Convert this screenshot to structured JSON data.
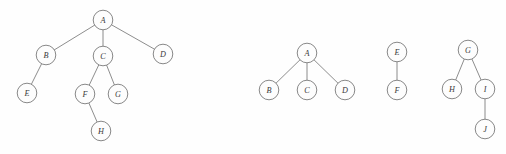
{
  "figure": {
    "background_color": "#fefefe",
    "node_fill": "#fdfdfd",
    "node_stroke": "#7a7a7a",
    "edge_color": "#808080",
    "label_color": "#3a3a3a",
    "node_radius": 9.8,
    "width": 506,
    "height": 154
  },
  "graphs": [
    {
      "id": "tree-1",
      "name": "tree-left-abcdefgh",
      "root": "A",
      "nodes": [
        {
          "id": "A",
          "label": "A",
          "x": 103,
          "y": 20
        },
        {
          "id": "B",
          "label": "B",
          "x": 46,
          "y": 55
        },
        {
          "id": "C",
          "label": "C",
          "x": 103,
          "y": 56
        },
        {
          "id": "D",
          "label": "D",
          "x": 163,
          "y": 54
        },
        {
          "id": "E",
          "label": "E",
          "x": 27,
          "y": 93
        },
        {
          "id": "F",
          "label": "F",
          "x": 85,
          "y": 94
        },
        {
          "id": "G",
          "label": "G",
          "x": 118,
          "y": 94
        },
        {
          "id": "H",
          "label": "H",
          "x": 101,
          "y": 131
        }
      ],
      "edges": [
        {
          "from": "A",
          "to": "B"
        },
        {
          "from": "A",
          "to": "C"
        },
        {
          "from": "A",
          "to": "D"
        },
        {
          "from": "B",
          "to": "E"
        },
        {
          "from": "C",
          "to": "F"
        },
        {
          "from": "C",
          "to": "G"
        },
        {
          "from": "F",
          "to": "H"
        }
      ]
    },
    {
      "id": "tree-2",
      "name": "tree-abcd",
      "root": "A",
      "nodes": [
        {
          "id": "A",
          "label": "A",
          "x": 307,
          "y": 53
        },
        {
          "id": "B",
          "label": "B",
          "x": 269,
          "y": 90
        },
        {
          "id": "C",
          "label": "C",
          "x": 307,
          "y": 90
        },
        {
          "id": "D",
          "label": "D",
          "x": 345,
          "y": 90
        }
      ],
      "edges": [
        {
          "from": "A",
          "to": "B"
        },
        {
          "from": "A",
          "to": "C"
        },
        {
          "from": "A",
          "to": "D"
        }
      ]
    },
    {
      "id": "tree-3",
      "name": "tree-ef",
      "root": "E",
      "nodes": [
        {
          "id": "E",
          "label": "E",
          "x": 397,
          "y": 52
        },
        {
          "id": "F",
          "label": "F",
          "x": 397,
          "y": 90
        }
      ],
      "edges": [
        {
          "from": "E",
          "to": "F"
        }
      ]
    },
    {
      "id": "tree-4",
      "name": "tree-ghij",
      "root": "G",
      "nodes": [
        {
          "id": "G",
          "label": "G",
          "x": 468,
          "y": 50
        },
        {
          "id": "H",
          "label": "H",
          "x": 452,
          "y": 89
        },
        {
          "id": "I",
          "label": "I",
          "x": 485,
          "y": 89
        },
        {
          "id": "J",
          "label": "J",
          "x": 485,
          "y": 129
        }
      ],
      "edges": [
        {
          "from": "G",
          "to": "H"
        },
        {
          "from": "G",
          "to": "I"
        },
        {
          "from": "I",
          "to": "J"
        }
      ]
    }
  ]
}
